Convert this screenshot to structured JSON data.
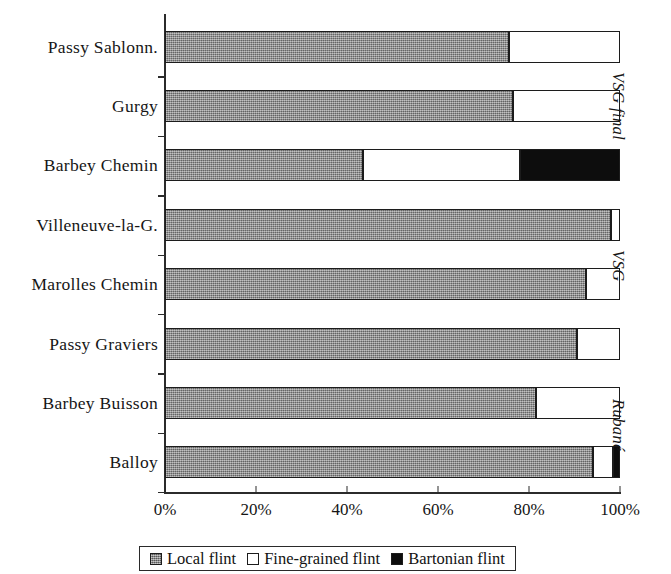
{
  "chart_data": {
    "type": "bar",
    "subtype": "horizontal-100-percent-stacked",
    "title": "",
    "xlabel": "",
    "ylabel": "",
    "xlim": [
      0,
      100
    ],
    "grid": false,
    "legend_position": "bottom",
    "categories": [
      "Passy Sablonn.",
      "Gurgy",
      "Barbey  Chemin",
      "Villeneuve-la-G.",
      "Marolles  Chemin",
      "Passy  Graviers",
      "Barbey Buisson",
      "Balloy"
    ],
    "series": [
      {
        "name": "Local flint",
        "color": "#8d8d8d",
        "values": [
          75.5,
          76.5,
          43.5,
          98.0,
          92.5,
          90.5,
          81.5,
          94.0
        ]
      },
      {
        "name": "Fine-grained flint",
        "color": "#ffffff",
        "values": [
          24.5,
          23.5,
          34.5,
          2.0,
          7.5,
          9.5,
          18.5,
          4.5
        ]
      },
      {
        "name": "Bartonian flint",
        "color": "#0d0d0d",
        "values": [
          0,
          0,
          22.0,
          0,
          0,
          0,
          0,
          1.5
        ]
      }
    ],
    "x_tick_labels": [
      "0%",
      "20%",
      "40%",
      "60%",
      "80%",
      "100%"
    ],
    "x_tick_values": [
      0,
      20,
      40,
      60,
      80,
      100
    ],
    "group_labels": [
      {
        "label": "VSG final",
        "categories": [
          "Passy Sablonn.",
          "Gurgy",
          "Barbey  Chemin"
        ]
      },
      {
        "label": "VSG",
        "categories": [
          "Villeneuve-la-G.",
          "Marolles  Chemin",
          "Passy  Graviers"
        ]
      },
      {
        "label": "Rubané",
        "categories": [
          "Barbey Buisson",
          "Balloy"
        ]
      }
    ]
  }
}
